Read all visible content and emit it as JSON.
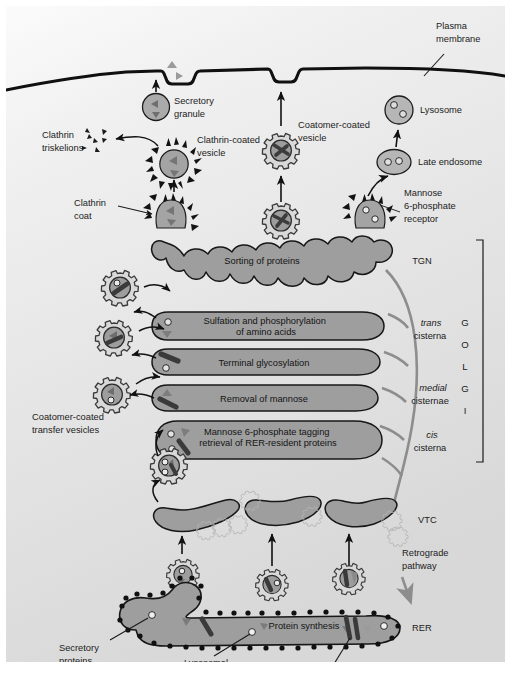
{
  "figure": {
    "background_top_color": "#f4f4f4",
    "background_bottom_color": "#dcdcdc",
    "membrane_color": "#101010",
    "organelle_fill": "#a3a3a3",
    "organelle_stroke": "#1a1a1a",
    "coat_fill": "#d6d6d6",
    "arrow_color": "#111111",
    "retrograde_color": "#8a8a8a"
  },
  "labels": {
    "plasma_membrane": {
      "line1": "Plasma",
      "line2": "membrane"
    },
    "secretory_granule": {
      "line1": "Secretory",
      "line2": "granule"
    },
    "clathrin_triskelions": {
      "line1": "Clathrin",
      "line2": "triskelions"
    },
    "clathrin_coated_vesicle": {
      "line1": "Clathrin-coated",
      "line2": "vesicle"
    },
    "clathrin_coat": {
      "line1": "Clathrin",
      "line2": "coat"
    },
    "coatomer_coated_vesicle": {
      "line1": "Coatomer-coated",
      "line2": "vesicle"
    },
    "lysosome": {
      "line1": "Lysosome"
    },
    "late_endosome": {
      "line1": "Late endosome"
    },
    "mannose_receptor": {
      "line1": "Mannose",
      "line2": "6-phosphate",
      "line3": "receptor"
    },
    "coatomer_transfer_vesicles": {
      "line1": "Coatomer-coated",
      "line2": "transfer vesicles"
    },
    "retrograde_pathway": {
      "line1": "Retrograde",
      "line2": "pathway"
    },
    "secretory_proteins": {
      "line1": "Secretory",
      "line2": "proteins"
    },
    "lysosomal_proteins": {
      "line1": "Lysosomal",
      "line2": "proteins"
    },
    "plasma_membrane_proteins": {
      "line1": "Plasma membrane proteins"
    },
    "vtc": "VTC",
    "rer": "RER",
    "tgn": "TGN"
  },
  "cisternae": [
    {
      "id": "tgn",
      "function_text": "Sorting of proteins",
      "side_label_italic": "",
      "side_label_plain": "TGN"
    },
    {
      "id": "trans",
      "function_line1": "Sulfation and phosphorylation",
      "function_line2": "of amino acids",
      "side_label_italic": "trans",
      "side_label_plain": "cisterna"
    },
    {
      "id": "medial-upper",
      "function_line1": "Terminal glycosylation",
      "function_line2": "",
      "side_label_italic": "",
      "side_label_plain": ""
    },
    {
      "id": "medial-lower",
      "function_line1": "Removal of mannose",
      "function_line2": "",
      "side_label_italic": "medial",
      "side_label_plain": "cisternae"
    },
    {
      "id": "cis",
      "function_line1": "Mannose 6-phosphate tagging",
      "function_line2": "retrieval of RER-resident proteins",
      "side_label_italic": "cis",
      "side_label_plain": "cisterna"
    }
  ],
  "golgi_word_letters": [
    "G",
    "O",
    "L",
    "G",
    "I"
  ],
  "rer_text": "Protein synthesis"
}
